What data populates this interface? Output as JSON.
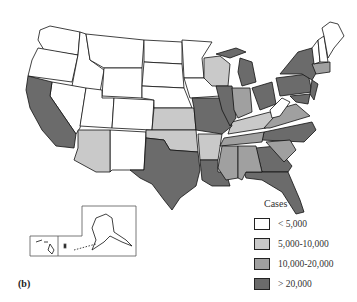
{
  "figure": {
    "panel_label": "(b)",
    "title": "",
    "colors": {
      "lt5000": "#ffffff",
      "5000_10000": "#c9c9c9",
      "10000_20000": "#a0a0a0",
      "gt20000": "#6b6b6b",
      "border": "#111111"
    }
  },
  "legend": {
    "title": "Cases",
    "items": [
      {
        "label": "< 5,000",
        "color": "#ffffff"
      },
      {
        "label": "5,000-10,000",
        "color": "#c9c9c9"
      },
      {
        "label": "10,000-20,000",
        "color": "#a0a0a0"
      },
      {
        "label": "> 20,000",
        "color": "#6b6b6b"
      }
    ]
  },
  "map_data": {
    "type": "choropleth",
    "region": "United States",
    "categories": [
      "< 5,000",
      "5,000-10,000",
      "10,000-20,000",
      "> 20,000"
    ],
    "states": {
      "> 20,000": [
        "CA",
        "TX",
        "MO",
        "IL",
        "MI",
        "OH",
        "PA",
        "NY",
        "NJ",
        "MD",
        "NC",
        "GA",
        "FL",
        "LA"
      ],
      "10,000-20,000": [
        "IN",
        "TN",
        "AL",
        "MS",
        "SC",
        "VA",
        "WV?",
        "CT",
        "MA"
      ],
      "5,000-10,000": [
        "AZ",
        "OK",
        "AR",
        "KY",
        "WI",
        "KS"
      ],
      "< 5,000": [
        "WA",
        "OR",
        "ID",
        "MT",
        "WY",
        "ND",
        "SD",
        "NE",
        "NV",
        "UT",
        "CO",
        "NM",
        "MN",
        "IA",
        "ME",
        "NH",
        "VT",
        "WV",
        "AK",
        "HI"
      ]
    }
  }
}
